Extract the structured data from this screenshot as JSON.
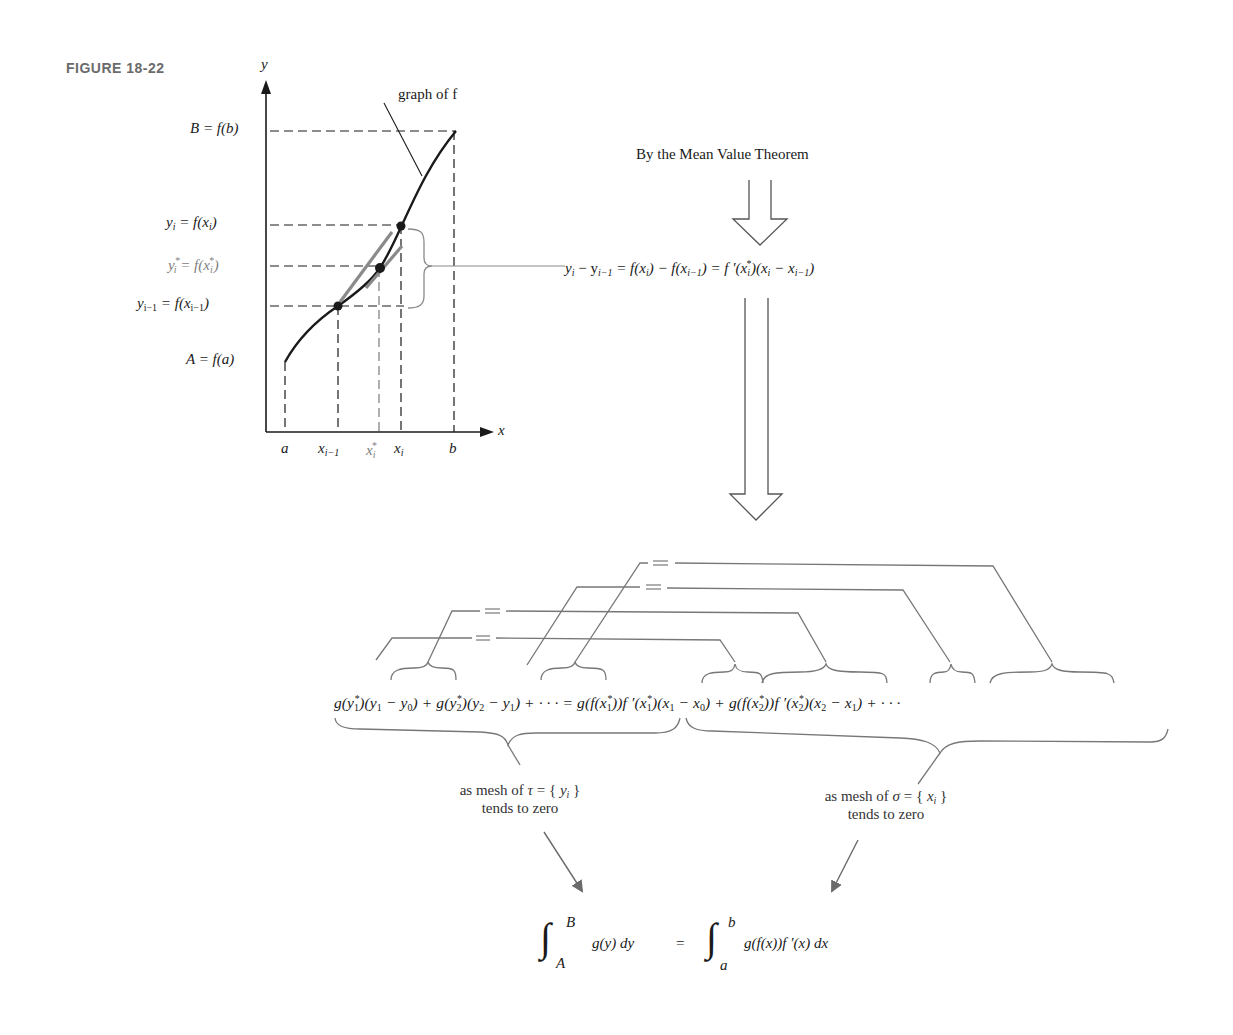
{
  "figure": {
    "label": "FIGURE 18-22"
  },
  "graph": {
    "y_axis_label": "y",
    "x_axis_label": "x",
    "curve_label": "graph of f",
    "y_labels": {
      "B": "B = f(b)",
      "yi_lhs": "y",
      "yi_sub": "i",
      "yi_rhs": " = f(x",
      "yi_rhs_sub": "i",
      "yi_close": ")",
      "ystar_lhs": "y",
      "ystar_sub": "i",
      "ystar_sup": "*",
      "ystar_rhs": " = f(x",
      "ystar_rhs_sub": "i",
      "ystar_rhs_sup": "*",
      "ystar_close": ")",
      "yim1_lhs": "y",
      "yim1_sub": "i−1",
      "yim1_rhs": " = f(x",
      "yim1_rhs_sub": "i−1",
      "yim1_close": ")",
      "A": "A = f(a)"
    },
    "x_labels": {
      "a": "a",
      "xim1": "x",
      "xim1_sub": "i−1",
      "xstar": "x",
      "xstar_sub": "i",
      "xstar_sup": "*",
      "xi": "x",
      "xi_sub": "i",
      "b": "b"
    }
  },
  "flow": {
    "mvt_caption": "By the Mean Value Theorem",
    "mvt_equation": "yᵢ − yᵢ₋₁ = f(xᵢ) − f(xᵢ₋₁) = f ′(xᵢ*)(xᵢ − xᵢ₋₁)",
    "mvt_equation_parts": {
      "p1": "y",
      "p1s": "i",
      "p2": " − y",
      "p2s": "i−1",
      "p3": " = f(x",
      "p3s": "i",
      "p4": ") − f(x",
      "p4s": "i−1",
      "p5": ") = f ′(x",
      "p5s": "i",
      "p5sup": "*",
      "p6": ")(x",
      "p6s": "i",
      "p7": " − x",
      "p7s": "i−1",
      "p8": ")"
    },
    "sum_equation": "g(y₁*)(y₁ − y₀) + g(y₂*)(y₂ − y₁) + · · · = g(f(x₁*))f′(x₁*)(x₁ − x₀) + g(f(x₂*))f′(x₂*)(x₂ − x₁) + · · ·",
    "sum_parts": {
      "l1": "g(y",
      "l1s": "1",
      "l1p": "*",
      "l2": ")(y",
      "l2s": "1",
      "l3": " − y",
      "l3s": "0",
      "l4": ") + g(y",
      "l4s": "2",
      "l4p": "*",
      "l5": ")(y",
      "l5s": "2",
      "l6": " − y",
      "l6s": "1",
      "l7": ") + · · · = g(f(x",
      "l7s": "1",
      "l7p": "*",
      "l8": "))f ′(x",
      "l8s": "1",
      "l8p": "*",
      "l9": ")(x",
      "l9s": "1",
      "l10": " − x",
      "l10s": "0",
      "l11": ") + g(f(x",
      "l11s": "2",
      "l11p": "*",
      "l12": "))f ′(x",
      "l12s": "2",
      "l12p": "*",
      "l13": ")(x",
      "l13s": "2",
      "l14": " − x",
      "l14s": "1",
      "l15": ") + · · ·"
    },
    "equals_sign": "=",
    "left_note": {
      "line1_prefix": "as mesh of ",
      "line1_var": "τ",
      "line1_eq": " = { ",
      "line1_set": "y",
      "line1_set_sub": "i",
      "line1_close": " }",
      "line2": "tends to zero"
    },
    "right_note": {
      "line1_prefix": "as mesh of ",
      "line1_var": "σ",
      "line1_eq": " = { ",
      "line1_set": "x",
      "line1_set_sub": "i",
      "line1_close": " }",
      "line2": "tends to zero"
    },
    "final_equation": {
      "int_symbol": "∫",
      "left_upper": "B",
      "left_lower": "A",
      "left_integrand": "g(y) dy",
      "equals": "=",
      "right_upper": "b",
      "right_lower": "a",
      "right_integrand": "g(f(x))f ′(x) dx"
    }
  },
  "colors": {
    "ink": "#1a1a1a",
    "gray_ink": "#808080",
    "connector": "#777777",
    "background": "#ffffff"
  }
}
